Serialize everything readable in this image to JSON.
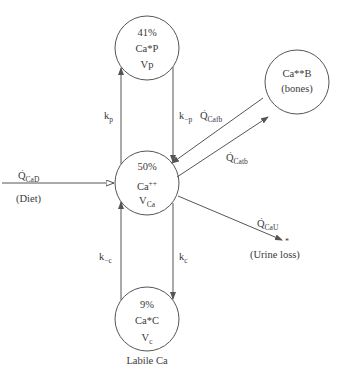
{
  "diagram": {
    "type": "compartment-model",
    "caption": "Labile Ca",
    "colors": {
      "stroke": "#555555",
      "text": "#3a3a3a",
      "background": "#ffffff"
    },
    "compartments": [
      {
        "id": "plasma_bound",
        "percent": "41%",
        "name": "Ca*P",
        "volume": "Vp"
      },
      {
        "id": "ionized",
        "percent": "50%",
        "name": "Ca",
        "name_sup": "++",
        "volume": "V",
        "volume_sub": "Ca"
      },
      {
        "id": "cellular",
        "percent": "9%",
        "name": "Ca*C",
        "volume": "V",
        "volume_sub": "c"
      },
      {
        "id": "bones",
        "name": "Ca**B",
        "subtitle": "(bones)"
      }
    ],
    "rates": {
      "kp": {
        "base": "k",
        "sub": "p"
      },
      "k_minus_p": {
        "base": "k",
        "sub": "−p"
      },
      "kc": {
        "base": "k",
        "sub": "c"
      },
      "k_minus_c": {
        "base": "k",
        "sub": "−c"
      }
    },
    "flows": {
      "diet": {
        "base": "Q",
        "sub": "CaD",
        "dot": "·",
        "note": "(Diet)"
      },
      "to_bone": {
        "base": "Q",
        "sub": "Cafb",
        "dot": "·"
      },
      "from_bone": {
        "base": "Q",
        "sub": "Catb",
        "dot": "·"
      },
      "urine": {
        "base": "Q",
        "sub": "CaU",
        "dot": "·",
        "note": "(Urine loss)",
        "sink": "*"
      }
    }
  }
}
